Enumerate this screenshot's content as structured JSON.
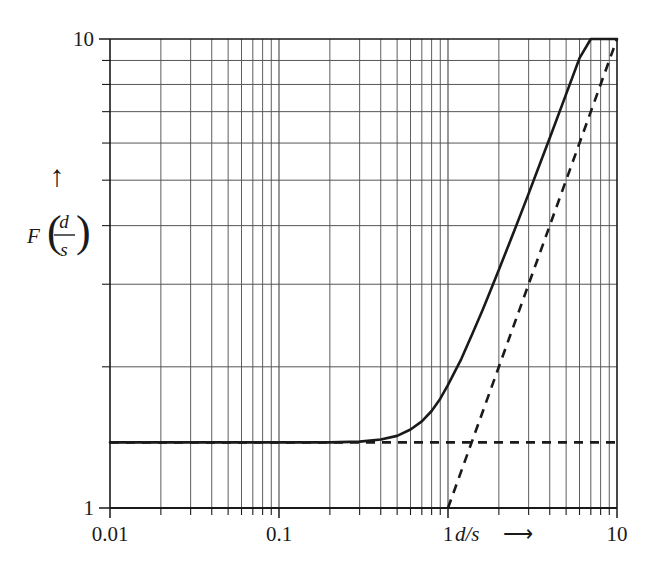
{
  "figure": {
    "background_color": "#ffffff",
    "ink_color": "#1a1a1a",
    "grid_color": "#555555"
  },
  "axes": {
    "x_label": "d/s",
    "x_label_arrow": "⟶",
    "y_label_function": "F",
    "y_label_numerator": "d",
    "y_label_denominator": "s",
    "y_label_arrow": "↑",
    "x_ticks": [
      "0.01",
      "0.1",
      "1",
      "10"
    ],
    "y_ticks": [
      "1",
      "10"
    ]
  },
  "chart_data": {
    "type": "line",
    "title": "",
    "subtitle": "",
    "xlabel": "d/s ⟶",
    "ylabel": "F (d/s)",
    "xscale": "log",
    "yscale": "log",
    "xlim": [
      0.01,
      10
    ],
    "ylim": [
      1,
      10
    ],
    "grid": true,
    "grid_style": "log minor gridlines on both axes",
    "legend": "none",
    "x_tick_labels": [
      "0.01",
      "0.1",
      "1",
      "10"
    ],
    "y_tick_labels": [
      "1",
      "10"
    ],
    "series": [
      {
        "name": "F(d/s)",
        "style": "solid",
        "linewidth": 2.6,
        "note": "smooth transition curve; horizontal plateau at low d/s, slope-1 asymptote at high d/s",
        "x": [
          0.01,
          0.02,
          0.03,
          0.05,
          0.07,
          0.1,
          0.15,
          0.2,
          0.3,
          0.4,
          0.5,
          0.6,
          0.7,
          0.8,
          0.9,
          1.0,
          1.2,
          1.4,
          1.6,
          1.8,
          2.0,
          2.5,
          3.0,
          3.5,
          4.0,
          5.0,
          6.0,
          7.0,
          8.0,
          9.0,
          10.0
        ],
        "y": [
          1.38,
          1.38,
          1.38,
          1.38,
          1.38,
          1.38,
          1.38,
          1.38,
          1.385,
          1.4,
          1.425,
          1.47,
          1.53,
          1.61,
          1.71,
          1.83,
          2.08,
          2.36,
          2.64,
          2.93,
          3.22,
          3.95,
          4.68,
          5.42,
          6.15,
          7.63,
          9.1,
          10.0,
          10.0,
          10.0,
          10.0
        ]
      },
      {
        "name": "horizontal asymptote",
        "style": "dashed",
        "linewidth": 2.6,
        "note": "constant plateau level",
        "x": [
          0.01,
          10.0
        ],
        "y": [
          1.38,
          1.38
        ]
      },
      {
        "name": "diagonal asymptote",
        "style": "dashed",
        "linewidth": 2.6,
        "note": "slope-1 line through (1,1) on log-log axes",
        "x": [
          1.0,
          10.0
        ],
        "y": [
          1.0,
          10.0
        ]
      }
    ]
  }
}
